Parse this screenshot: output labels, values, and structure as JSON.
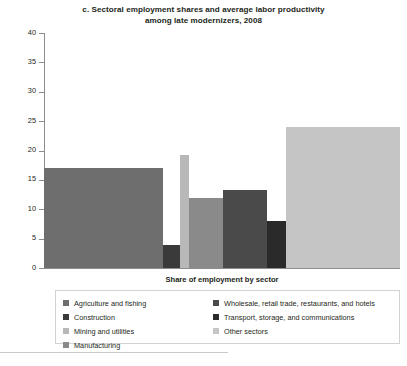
{
  "chart_data": {
    "type": "bar",
    "title": "c. Sectoral employment shares and average labor productivity among late modernizers, 2008",
    "title_line1": "c. Sectoral employment shares and average labor productivity",
    "title_line2": "among late modernizers, 2008",
    "xlabel": "Share of employment by sector",
    "ylabel": "Share of value added by sector",
    "ylim": [
      0,
      40
    ],
    "yticks": [
      0,
      5,
      10,
      15,
      20,
      25,
      30,
      35,
      40
    ],
    "ytick_labels": [
      "0",
      "5",
      "10",
      "15",
      "20",
      "25",
      "30",
      "35",
      "40"
    ],
    "grid": false,
    "legend_position": "below-plot",
    "note": "Variable-width (Marimekko) bar chart: bar width = share of employment by sector, bar height = share of value added by sector.",
    "categories": [
      "Agriculture and fishing",
      "Construction",
      "Mining and utilities",
      "Manufacturing",
      "Wholesale, retail trade, restaurants, and hotels",
      "Transport, storage, and communications",
      "Other sectors"
    ],
    "values": [
      17.0,
      4.0,
      19.3,
      12.0,
      13.3,
      8.0,
      24.0
    ],
    "widths": [
      33.5,
      4.6,
      2.6,
      9.6,
      12.4,
      5.4,
      32.0
    ],
    "colors": [
      "#6e6e6e",
      "#3a3a3a",
      "#b8b8b8",
      "#8a8a8a",
      "#4a4a4a",
      "#2a2a2a",
      "#c5c5c5"
    ],
    "bars": [
      {
        "label": "Agriculture and fishing",
        "value": 17.0,
        "width": 33.5,
        "x_start": 0.0,
        "color": "#6e6e6e"
      },
      {
        "label": "Construction",
        "value": 4.0,
        "width": 4.6,
        "x_start": 33.5,
        "color": "#3a3a3a"
      },
      {
        "label": "Mining and utilities",
        "value": 19.3,
        "width": 2.6,
        "x_start": 38.1,
        "color": "#b8b8b8"
      },
      {
        "label": "Manufacturing",
        "value": 12.0,
        "width": 9.6,
        "x_start": 40.7,
        "color": "#8a8a8a"
      },
      {
        "label": "Wholesale, retail trade, restaurants, and hotels",
        "value": 13.3,
        "width": 12.4,
        "x_start": 50.3,
        "color": "#4a4a4a"
      },
      {
        "label": "Transport, storage, and communications",
        "value": 8.0,
        "width": 5.4,
        "x_start": 62.7,
        "color": "#2a2a2a"
      },
      {
        "label": "Other sectors",
        "value": 24.0,
        "width": 32.0,
        "x_start": 68.1,
        "color": "#c5c5c5"
      }
    ]
  },
  "legend": {
    "left_column": [
      {
        "label": "Agriculture and fishing",
        "color": "#6e6e6e"
      },
      {
        "label": "Construction",
        "color": "#3a3a3a"
      },
      {
        "label": "Mining and utilities",
        "color": "#b8b8b8"
      },
      {
        "label": "Manufacturing",
        "color": "#8a8a8a"
      }
    ],
    "right_column": [
      {
        "label": "Wholesale, retail trade, restaurants, and hotels",
        "color": "#4a4a4a"
      },
      {
        "label": "Transport, storage, and communications",
        "color": "#2a2a2a"
      },
      {
        "label": "Other sectors",
        "color": "#c5c5c5"
      }
    ]
  },
  "footer": {
    "text": ""
  }
}
